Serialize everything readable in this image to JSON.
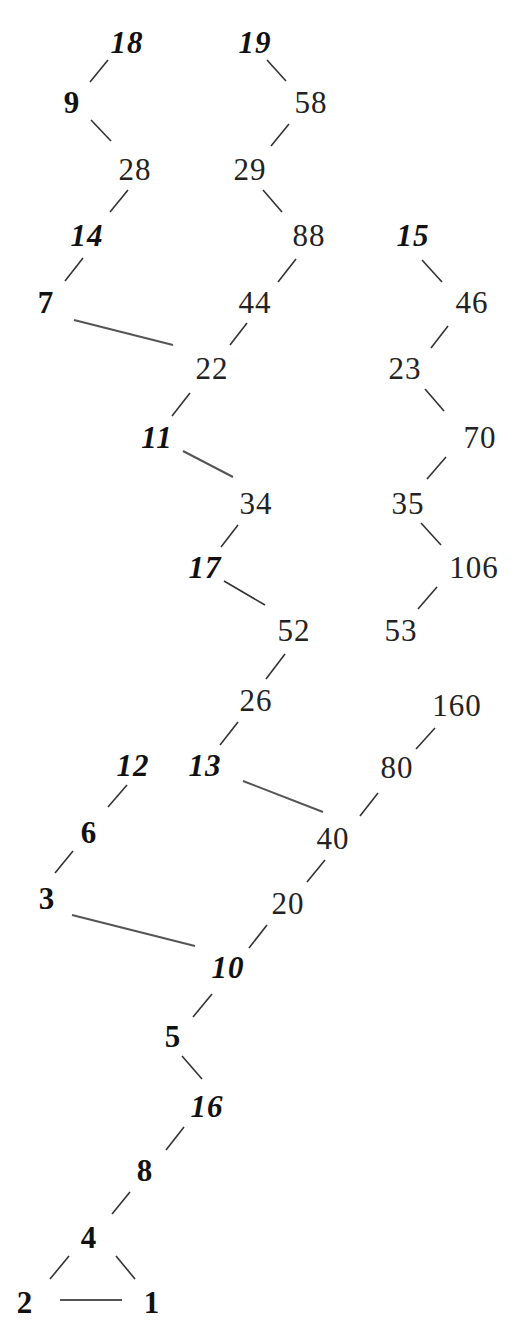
{
  "diagram": {
    "styles": {
      "small": "bold upright (1-9)",
      "teen": "bold italic (10-19)",
      "large": "regular (20+)"
    },
    "nodes": [
      {
        "id": "n18",
        "label": "18",
        "x": 127,
        "y": 42,
        "style": "teen"
      },
      {
        "id": "n19",
        "label": "19",
        "x": 255,
        "y": 42,
        "style": "teen"
      },
      {
        "id": "n9",
        "label": "9",
        "x": 72,
        "y": 102,
        "style": "small"
      },
      {
        "id": "n58",
        "label": "58",
        "x": 311,
        "y": 102,
        "style": "large"
      },
      {
        "id": "n28",
        "label": "28",
        "x": 135,
        "y": 169,
        "style": "large"
      },
      {
        "id": "n29",
        "label": "29",
        "x": 250,
        "y": 169,
        "style": "large"
      },
      {
        "id": "n14",
        "label": "14",
        "x": 87,
        "y": 235,
        "style": "teen"
      },
      {
        "id": "n88",
        "label": "88",
        "x": 309,
        "y": 235,
        "style": "large"
      },
      {
        "id": "n15",
        "label": "15",
        "x": 413,
        "y": 235,
        "style": "teen"
      },
      {
        "id": "n7",
        "label": "7",
        "x": 46,
        "y": 302,
        "style": "small"
      },
      {
        "id": "n44",
        "label": "44",
        "x": 255,
        "y": 302,
        "style": "large"
      },
      {
        "id": "n46",
        "label": "46",
        "x": 472,
        "y": 302,
        "style": "large"
      },
      {
        "id": "n22",
        "label": "22",
        "x": 212,
        "y": 368,
        "style": "large"
      },
      {
        "id": "n23",
        "label": "23",
        "x": 405,
        "y": 368,
        "style": "large"
      },
      {
        "id": "n11",
        "label": "11",
        "x": 157,
        "y": 437,
        "style": "teen"
      },
      {
        "id": "n70",
        "label": "70",
        "x": 480,
        "y": 437,
        "style": "large"
      },
      {
        "id": "n34",
        "label": "34",
        "x": 256,
        "y": 503,
        "style": "large"
      },
      {
        "id": "n35",
        "label": "35",
        "x": 408,
        "y": 503,
        "style": "large"
      },
      {
        "id": "n17",
        "label": "17",
        "x": 205,
        "y": 567,
        "style": "teen"
      },
      {
        "id": "n106",
        "label": "106",
        "x": 474,
        "y": 567,
        "style": "large"
      },
      {
        "id": "n52",
        "label": "52",
        "x": 294,
        "y": 630,
        "style": "large"
      },
      {
        "id": "n53",
        "label": "53",
        "x": 401,
        "y": 630,
        "style": "large"
      },
      {
        "id": "n26",
        "label": "26",
        "x": 256,
        "y": 700,
        "style": "large"
      },
      {
        "id": "n160",
        "label": "160",
        "x": 457,
        "y": 705,
        "style": "large"
      },
      {
        "id": "n12",
        "label": "12",
        "x": 133,
        "y": 765,
        "style": "teen"
      },
      {
        "id": "n13",
        "label": "13",
        "x": 205,
        "y": 765,
        "style": "teen"
      },
      {
        "id": "n80",
        "label": "80",
        "x": 397,
        "y": 767,
        "style": "large"
      },
      {
        "id": "n6",
        "label": "6",
        "x": 89,
        "y": 832,
        "style": "small"
      },
      {
        "id": "n40",
        "label": "40",
        "x": 333,
        "y": 838,
        "style": "large"
      },
      {
        "id": "n3",
        "label": "3",
        "x": 47,
        "y": 898,
        "style": "small"
      },
      {
        "id": "n20",
        "label": "20",
        "x": 288,
        "y": 903,
        "style": "large"
      },
      {
        "id": "n10",
        "label": "10",
        "x": 228,
        "y": 967,
        "style": "teen"
      },
      {
        "id": "n5",
        "label": "5",
        "x": 173,
        "y": 1036,
        "style": "small"
      },
      {
        "id": "n16",
        "label": "16",
        "x": 207,
        "y": 1106,
        "style": "teen"
      },
      {
        "id": "n8",
        "label": "8",
        "x": 145,
        "y": 1170,
        "style": "small"
      },
      {
        "id": "n4",
        "label": "4",
        "x": 89,
        "y": 1237,
        "style": "small"
      },
      {
        "id": "n2",
        "label": "2",
        "x": 25,
        "y": 1302,
        "style": "small"
      },
      {
        "id": "n1",
        "label": "1",
        "x": 152,
        "y": 1302,
        "style": "small"
      }
    ],
    "edges": [
      {
        "from": "18",
        "to": "9",
        "x1": 108,
        "y1": 60,
        "x2": 90,
        "y2": 82
      },
      {
        "from": "9",
        "to": "28",
        "x1": 91,
        "y1": 120,
        "x2": 111,
        "y2": 141
      },
      {
        "from": "19",
        "to": "58",
        "x1": 267,
        "y1": 60,
        "x2": 286,
        "y2": 81
      },
      {
        "from": "58",
        "to": "29",
        "x1": 289,
        "y1": 124,
        "x2": 271,
        "y2": 146
      },
      {
        "from": "28",
        "to": "14",
        "x1": 128,
        "y1": 190,
        "x2": 110,
        "y2": 212
      },
      {
        "from": "29",
        "to": "88",
        "x1": 263,
        "y1": 190,
        "x2": 282,
        "y2": 212
      },
      {
        "from": "14",
        "to": "7",
        "x1": 83,
        "y1": 258,
        "x2": 65,
        "y2": 281
      },
      {
        "from": "88",
        "to": "44",
        "x1": 296,
        "y1": 259,
        "x2": 278,
        "y2": 282
      },
      {
        "from": "15",
        "to": "46",
        "x1": 422,
        "y1": 260,
        "x2": 442,
        "y2": 282
      },
      {
        "from": "7",
        "to": "22",
        "x1": 74,
        "y1": 320,
        "x2": 173,
        "y2": 345
      },
      {
        "from": "44",
        "to": "22",
        "x1": 247,
        "y1": 323,
        "x2": 230,
        "y2": 345
      },
      {
        "from": "46",
        "to": "23",
        "x1": 448,
        "y1": 326,
        "x2": 431,
        "y2": 348
      },
      {
        "from": "22",
        "to": "11",
        "x1": 190,
        "y1": 393,
        "x2": 172,
        "y2": 416
      },
      {
        "from": "23",
        "to": "70",
        "x1": 425,
        "y1": 389,
        "x2": 444,
        "y2": 411
      },
      {
        "from": "11",
        "to": "34",
        "x1": 183,
        "y1": 451,
        "x2": 233,
        "y2": 477
      },
      {
        "from": "70",
        "to": "35",
        "x1": 446,
        "y1": 457,
        "x2": 427,
        "y2": 479
      },
      {
        "from": "34",
        "to": "17",
        "x1": 238,
        "y1": 525,
        "x2": 221,
        "y2": 547
      },
      {
        "from": "35",
        "to": "106",
        "x1": 421,
        "y1": 523,
        "x2": 441,
        "y2": 545
      },
      {
        "from": "17",
        "to": "52",
        "x1": 224,
        "y1": 581,
        "x2": 265,
        "y2": 605
      },
      {
        "from": "106",
        "to": "53",
        "x1": 437,
        "y1": 587,
        "x2": 418,
        "y2": 609
      },
      {
        "from": "52",
        "to": "26",
        "x1": 285,
        "y1": 654,
        "x2": 266,
        "y2": 679
      },
      {
        "from": "26",
        "to": "13",
        "x1": 238,
        "y1": 722,
        "x2": 220,
        "y2": 745
      },
      {
        "from": "160",
        "to": "80",
        "x1": 435,
        "y1": 728,
        "x2": 416,
        "y2": 749
      },
      {
        "from": "13",
        "to": "40",
        "x1": 243,
        "y1": 781,
        "x2": 323,
        "y2": 812
      },
      {
        "from": "80",
        "to": "40",
        "x1": 378,
        "y1": 793,
        "x2": 360,
        "y2": 816
      },
      {
        "from": "12",
        "to": "6",
        "x1": 127,
        "y1": 785,
        "x2": 108,
        "y2": 807
      },
      {
        "from": "6",
        "to": "3",
        "x1": 73,
        "y1": 851,
        "x2": 55,
        "y2": 873
      },
      {
        "from": "40",
        "to": "20",
        "x1": 325,
        "y1": 860,
        "x2": 307,
        "y2": 882
      },
      {
        "from": "3",
        "to": "10",
        "x1": 72,
        "y1": 915,
        "x2": 195,
        "y2": 946
      },
      {
        "from": "20",
        "to": "10",
        "x1": 267,
        "y1": 925,
        "x2": 249,
        "y2": 948
      },
      {
        "from": "10",
        "to": "5",
        "x1": 212,
        "y1": 994,
        "x2": 193,
        "y2": 1017
      },
      {
        "from": "5",
        "to": "16",
        "x1": 182,
        "y1": 1056,
        "x2": 202,
        "y2": 1079
      },
      {
        "from": "16",
        "to": "8",
        "x1": 184,
        "y1": 1127,
        "x2": 166,
        "y2": 1150
      },
      {
        "from": "8",
        "to": "4",
        "x1": 130,
        "y1": 1192,
        "x2": 112,
        "y2": 1214
      },
      {
        "from": "4",
        "to": "2",
        "x1": 69,
        "y1": 1256,
        "x2": 50,
        "y2": 1279
      },
      {
        "from": "4",
        "to": "1",
        "x1": 116,
        "y1": 1256,
        "x2": 135,
        "y2": 1279
      },
      {
        "from": "2",
        "to": "1",
        "x1": 60,
        "y1": 1300,
        "x2": 122,
        "y2": 1300
      }
    ]
  }
}
